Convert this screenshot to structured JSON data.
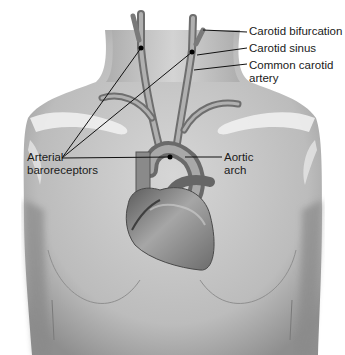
{
  "figure": {
    "labels": {
      "carotid_bifurcation": "Carotid bifurcation",
      "carotid_sinus": "Carotid sinus",
      "common_carotid_line1": "Common carotid",
      "common_carotid_line2": "artery",
      "baroreceptors_line1": "Arterial",
      "baroreceptors_line2": "baroreceptors",
      "aortic_line1": "Aortic",
      "aortic_line2": "arch"
    },
    "colors": {
      "skin": "#c9c9c9",
      "skin_shadow": "#9a9a9a",
      "vessel": "#8a8a8a",
      "heart": "#7d7d7d",
      "clavicle": "#ededed",
      "leader_line": "#111111"
    }
  }
}
